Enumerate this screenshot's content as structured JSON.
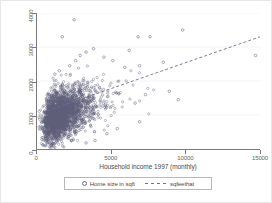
{
  "chart_data": {
    "type": "scatter",
    "title": "",
    "xlabel": "Household income 1997 (monthly)",
    "ylabel": "",
    "xlim": [
      0,
      15000
    ],
    "ylim": [
      0,
      4000
    ],
    "xticks": [
      0,
      5000,
      10000,
      15000
    ],
    "xticklabels": [
      "0",
      "5000",
      "10000",
      "15000"
    ],
    "yticks": [
      0,
      1000,
      2000,
      3000,
      4000
    ],
    "yticklabels": [
      "0",
      "1000",
      "2000",
      "3000",
      "4000"
    ],
    "grid": "horizontal",
    "legend_position": "below-axes",
    "marker_color": "#5d5d7a",
    "line_color": "#6f6f8f",
    "axis_color": "#7a7a7a",
    "grid_color": "#eeeef4",
    "series": [
      {
        "name": "Home size in sqft",
        "type": "scatter",
        "marker": "open-circle",
        "n_points": 2400,
        "cluster": {
          "x_center": 1900,
          "y_center": 1050,
          "x_spread": 900,
          "y_spread": 430,
          "correlation": 0.32
        },
        "outliers": [
          [
            2500,
            3800
          ],
          [
            1700,
            3300
          ],
          [
            6800,
            3300
          ],
          [
            7600,
            3300
          ],
          [
            9800,
            3500
          ],
          [
            14700,
            2750
          ],
          [
            3800,
            2950
          ],
          [
            6200,
            2900
          ],
          [
            8500,
            2550
          ],
          [
            6900,
            2450
          ],
          [
            5900,
            2400
          ],
          [
            5100,
            2600
          ],
          [
            4500,
            2700
          ],
          [
            3300,
            2850
          ],
          [
            2900,
            2750
          ],
          [
            2600,
            2600
          ],
          [
            2200,
            2450
          ],
          [
            1500,
            2300
          ],
          [
            1200,
            2200
          ],
          [
            8900,
            1700
          ],
          [
            9500,
            1450
          ],
          [
            7300,
            1600
          ],
          [
            6600,
            1350
          ],
          [
            6900,
            800
          ],
          [
            5400,
            600
          ],
          [
            4700,
            450
          ],
          [
            3900,
            250
          ],
          [
            3300,
            180
          ]
        ]
      },
      {
        "name": "sqfeethat",
        "type": "line",
        "style": "dashed",
        "endpoints": [
          [
            400,
            1080
          ],
          [
            15000,
            3300
          ]
        ],
        "slope": 0.152,
        "intercept": 1019
      }
    ]
  },
  "axes": {
    "x_title": "Household income 1997 (monthly)"
  },
  "legend": {
    "entries": [
      {
        "label": "Home size in sqft",
        "marker": "scatter-marker-icon"
      },
      {
        "label": "sqfeethat",
        "marker": "dashed-line-icon"
      }
    ]
  }
}
